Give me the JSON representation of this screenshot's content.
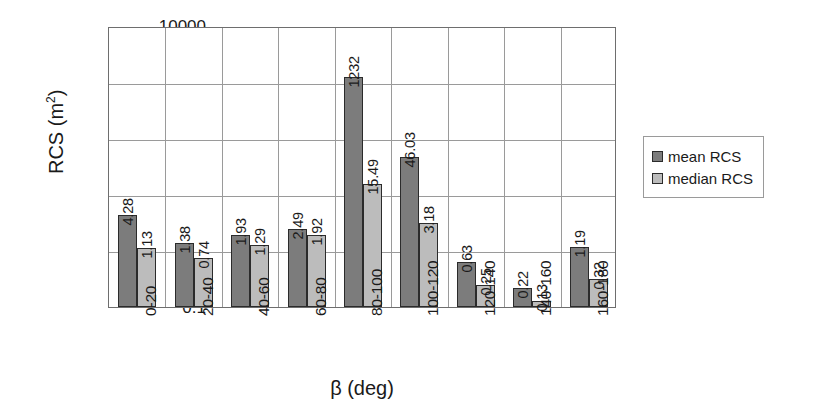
{
  "chart_data": {
    "type": "bar",
    "title": "",
    "xlabel": "β (deg)",
    "ylabel": "RCS (m²)",
    "ylabel_text": "RCS (m",
    "ylabel_sup": "2",
    "ylabel_tail": ")",
    "yscale": "log",
    "ylim": [
      0.1,
      10000
    ],
    "ytick_labels": [
      "10000",
      "1000",
      "100",
      "10",
      "1",
      "0.1"
    ],
    "grid": true,
    "grid_axes": "both",
    "legend_position": "right",
    "categories": [
      "0-20",
      "20-40",
      "40-60",
      "60-80",
      "80-100",
      "100-120",
      "120-140",
      "140-160",
      "160-180"
    ],
    "series": [
      {
        "name": "mean RCS",
        "color": "#7c7c7c",
        "values": [
          4.28,
          1.38,
          1.93,
          2.49,
          1232,
          46.03,
          0.63,
          0.22,
          1.19
        ],
        "labels": [
          "4.28",
          "1.38",
          "1.93",
          "2.49",
          "1232",
          "46.03",
          "0.63",
          "0.22",
          "1.19"
        ]
      },
      {
        "name": "median RCS",
        "color": "#bcbcbc",
        "values": [
          1.13,
          0.74,
          1.29,
          1.92,
          15.49,
          3.18,
          0.25,
          0.13,
          0.32
        ],
        "labels": [
          "1.13",
          "0.74",
          "1.29",
          "1.92",
          "15.49",
          "3.18",
          "0.25",
          "0.13",
          "0.32"
        ]
      }
    ]
  },
  "legend": {
    "items": [
      {
        "label": "mean RCS",
        "color": "#7c7c7c"
      },
      {
        "label": "median RCS",
        "color": "#bcbcbc"
      }
    ]
  }
}
